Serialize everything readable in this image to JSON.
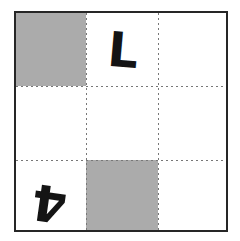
{
  "figure": {
    "rows": 3,
    "columns": 3,
    "border_color": "#262626",
    "shade_color": "#ababab",
    "glyph_color": "#141414",
    "grid_line_color": "#777777",
    "background_color": "#ffffff"
  },
  "cells": [
    {
      "row": 1,
      "column": 1,
      "name": "cell-r1c1",
      "fill": "shaded",
      "glyph": "",
      "rotation": 0
    },
    {
      "row": 1,
      "column": 2,
      "name": "cell-r1c2",
      "fill": "empty",
      "glyph": "L",
      "rotation": 5
    },
    {
      "row": 1,
      "column": 3,
      "name": "cell-r1c3",
      "fill": "empty",
      "glyph": "",
      "rotation": 0
    },
    {
      "row": 2,
      "column": 1,
      "name": "cell-r2c1",
      "fill": "empty",
      "glyph": "",
      "rotation": 0
    },
    {
      "row": 2,
      "column": 2,
      "name": "cell-r2c2",
      "fill": "empty",
      "glyph": "",
      "rotation": 0
    },
    {
      "row": 2,
      "column": 3,
      "name": "cell-r2c3",
      "fill": "empty",
      "glyph": "",
      "rotation": 0
    },
    {
      "row": 3,
      "column": 1,
      "name": "cell-r3c1",
      "fill": "empty",
      "glyph": "4",
      "rotation": 188
    },
    {
      "row": 3,
      "column": 2,
      "name": "cell-r3c2",
      "fill": "shaded",
      "glyph": "",
      "rotation": 0
    },
    {
      "row": 3,
      "column": 3,
      "name": "cell-r3c3",
      "fill": "empty",
      "glyph": "",
      "rotation": 0
    }
  ],
  "glyphs": {
    "top_middle": "L",
    "bottom_left": "4"
  }
}
